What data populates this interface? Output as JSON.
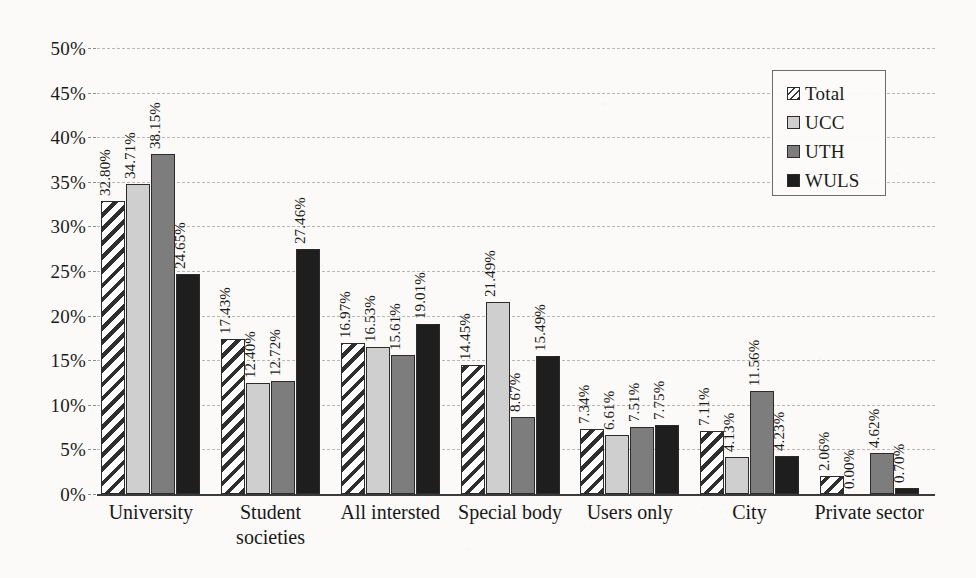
{
  "chart_data": {
    "type": "bar",
    "title": "",
    "subtitle": "",
    "xlabel": "",
    "ylabel": "",
    "ylim": [
      0,
      50
    ],
    "ytick_step": 5,
    "ytick_labels": [
      "0%",
      "5%",
      "10%",
      "15%",
      "20%",
      "25%",
      "30%",
      "35%",
      "40%",
      "45%",
      "50%"
    ],
    "value_suffix": "%",
    "grid": true,
    "legend_position": "top-right",
    "categories": [
      "University",
      "Student societies",
      "All intersted",
      "Special body",
      "Users only",
      "City",
      "Private sector"
    ],
    "category_lines": [
      [
        "University"
      ],
      [
        "Student",
        "societies"
      ],
      [
        "All intersted"
      ],
      [
        "Special body"
      ],
      [
        "Users only"
      ],
      [
        "City"
      ],
      [
        "Private sector"
      ]
    ],
    "series": [
      {
        "name": "Total",
        "pattern": "diagonal-hatch",
        "color": "#ffffff",
        "values": [
          32.8,
          17.43,
          16.97,
          14.45,
          7.34,
          7.11,
          2.06
        ],
        "labels": [
          "32.80%",
          "17.43%",
          "16.97%",
          "14.45%",
          "7.34%",
          "7.11%",
          "2.06%"
        ]
      },
      {
        "name": "UCC",
        "pattern": "solid",
        "color": "#cfcfcf",
        "values": [
          34.71,
          12.4,
          16.53,
          21.49,
          6.61,
          4.13,
          0.0
        ],
        "labels": [
          "34.71%",
          "12.40%",
          "16.53%",
          "21.49%",
          "6.61%",
          "4.13%",
          "0.00%"
        ]
      },
      {
        "name": "UTH",
        "pattern": "solid",
        "color": "#7d7d7d",
        "values": [
          38.15,
          12.72,
          15.61,
          8.67,
          7.51,
          11.56,
          4.62
        ],
        "labels": [
          "38.15%",
          "12.72%",
          "15.61%",
          "8.67%",
          "7.51%",
          "11.56%",
          "4.62%"
        ]
      },
      {
        "name": "WULS",
        "pattern": "solid",
        "color": "#1e1e1e",
        "values": [
          24.65,
          27.46,
          19.01,
          15.49,
          7.75,
          4.23,
          0.7
        ],
        "labels": [
          "24.65%",
          "27.46%",
          "19.01%",
          "15.49%",
          "7.75%",
          "4.23%",
          "0.70%"
        ]
      }
    ]
  },
  "legend": {
    "items": [
      {
        "label": "Total",
        "key": "total"
      },
      {
        "label": "UCC",
        "key": "ucc"
      },
      {
        "label": "UTH",
        "key": "uth"
      },
      {
        "label": "WULS",
        "key": "wuls"
      }
    ]
  },
  "colors": {
    "total": "#ffffff",
    "ucc": "#cfcfcf",
    "uth": "#7d7d7d",
    "wuls": "#1e1e1e",
    "gridline": "#b9b7b3",
    "axis": "#3a3a3a",
    "background": "#fbfaf8",
    "text": "#1b1b1b"
  }
}
